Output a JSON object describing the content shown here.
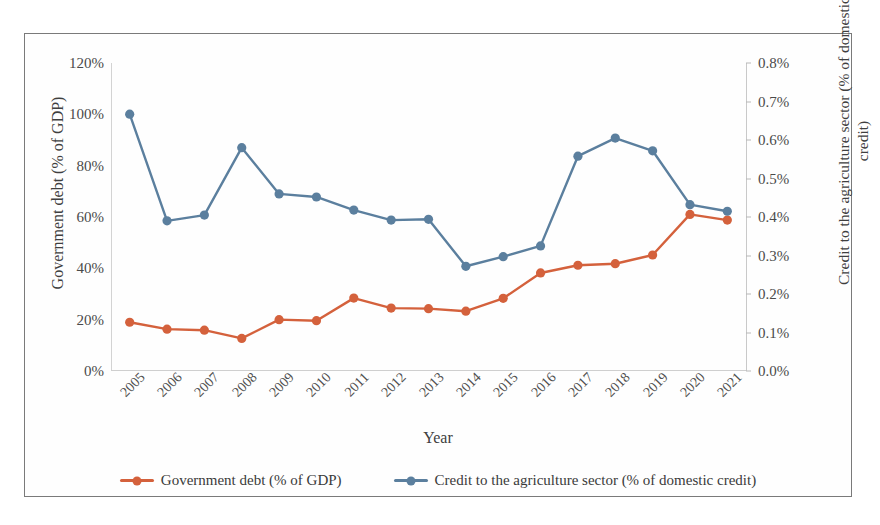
{
  "chart_data": {
    "type": "line",
    "title": "",
    "xlabel": "Year",
    "categories": [
      "2005",
      "2006",
      "2007",
      "2008",
      "2009",
      "2010",
      "2011",
      "2012",
      "2013",
      "2014",
      "2015",
      "2016",
      "2017",
      "2018",
      "2019",
      "2020",
      "2021"
    ],
    "grid": false,
    "legend_position": "bottom",
    "axes": {
      "left": {
        "label": "Government debt (% of GDP)",
        "ticks": [
          "0%",
          "20%",
          "40%",
          "60%",
          "80%",
          "100%",
          "120%"
        ],
        "tick_values": [
          0,
          20,
          40,
          60,
          80,
          100,
          120
        ],
        "ylim": [
          0,
          120
        ]
      },
      "right": {
        "label": "Credit to the agriculture sector (% of domestic credit)",
        "ticks": [
          "0.0%",
          "0.1%",
          "0.2%",
          "0.3%",
          "0.4%",
          "0.5%",
          "0.6%",
          "0.7%",
          "0.8%"
        ],
        "tick_values": [
          0.0,
          0.1,
          0.2,
          0.3,
          0.4,
          0.5,
          0.6,
          0.7,
          0.8
        ],
        "ylim": [
          0.0,
          0.8
        ]
      }
    },
    "series": [
      {
        "name": "Government debt (% of GDP)",
        "axis": "left",
        "color": "#D4613C",
        "values": [
          19.0,
          16.3,
          15.9,
          12.7,
          20.0,
          19.6,
          28.4,
          24.5,
          24.3,
          23.3,
          28.3,
          38.2,
          41.2,
          41.8,
          45.2,
          61.0,
          58.8
        ]
      },
      {
        "name": "Credit to the agriculture sector (% of domestic credit)",
        "axis": "right",
        "color": "#5B7F9E",
        "values": [
          0.667,
          0.39,
          0.405,
          0.58,
          0.46,
          0.452,
          0.418,
          0.392,
          0.394,
          0.272,
          0.297,
          0.325,
          0.558,
          0.605,
          0.572,
          0.432,
          0.415
        ]
      }
    ]
  },
  "legend": {
    "items": [
      {
        "label": "Government debt (% of GDP)",
        "color": "#D4613C"
      },
      {
        "label": "Credit to the agriculture sector (% of domestic credit)",
        "color": "#5B7F9E"
      }
    ]
  }
}
